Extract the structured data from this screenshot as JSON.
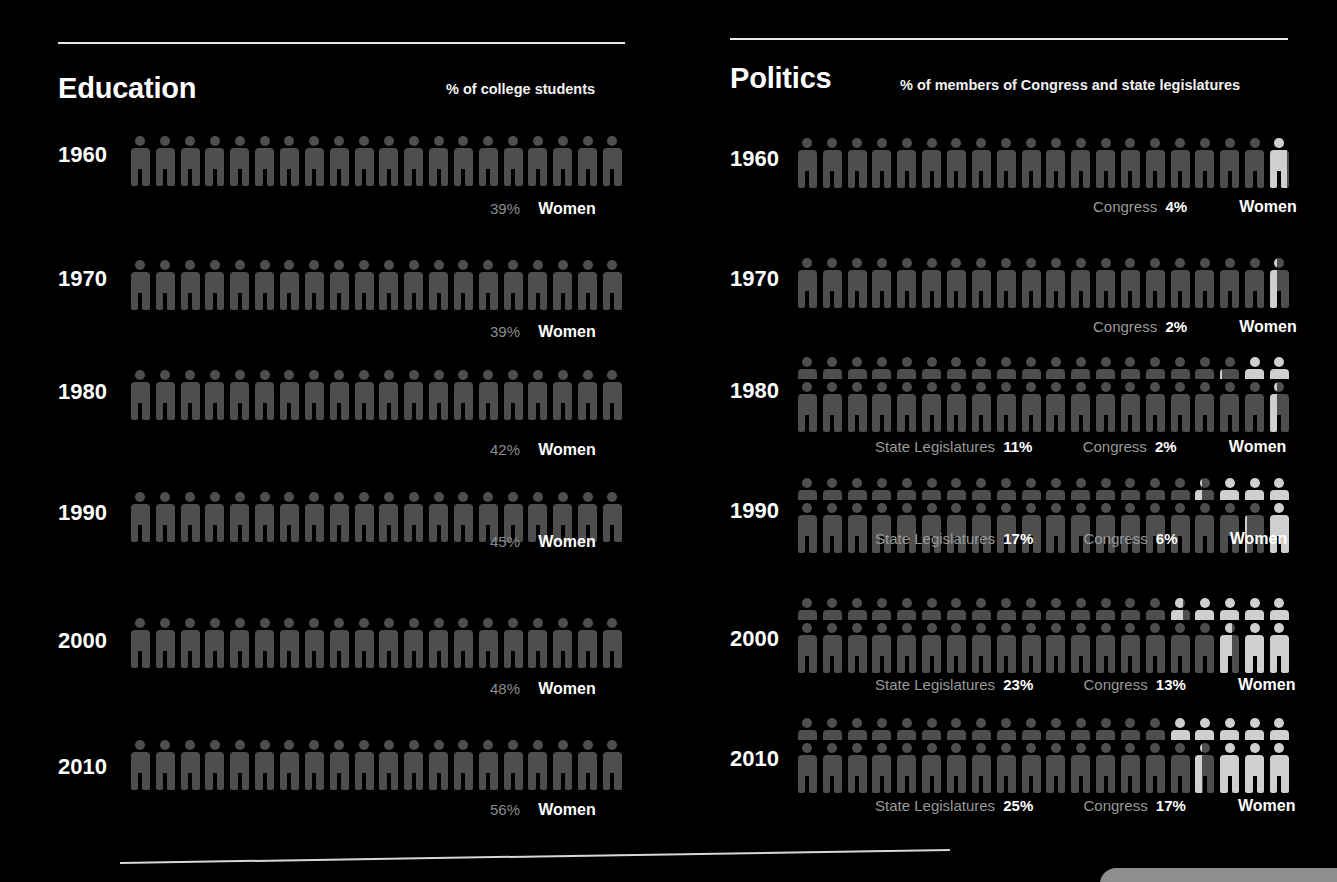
{
  "background_color": "#000000",
  "colors": {
    "figure_gray": "#4e4e4e",
    "figure_highlight": "#cfcfcf",
    "rule": "#e8e8e8",
    "caption_term": "#9a9a9a",
    "caption_value": "#ffffff"
  },
  "panels": {
    "education": {
      "title": "Education",
      "subtitle": "% of college students",
      "women_label": "Women",
      "rows": [
        {
          "year": "1960",
          "pct_label": "39%",
          "value": 39
        },
        {
          "year": "1970",
          "pct_label": "39%",
          "value": 39
        },
        {
          "year": "1980",
          "pct_label": "42%",
          "value": 42
        },
        {
          "year": "1990",
          "pct_label": "45%",
          "value": 45
        },
        {
          "year": "2000",
          "pct_label": "48%",
          "value": 48
        },
        {
          "year": "2010",
          "pct_label": "56%",
          "value": 56
        }
      ]
    },
    "politics": {
      "title": "Politics",
      "subtitle": "% of members of Congress and state legislatures",
      "women_label": "Women",
      "state_label": "State Legislatures",
      "congress_label": "Congress",
      "rows": [
        {
          "year": "1960",
          "state_pct_label": "",
          "state_value": null,
          "congress_pct_label": "4%",
          "congress_value": 4
        },
        {
          "year": "1970",
          "state_pct_label": "",
          "state_value": null,
          "congress_pct_label": "2%",
          "congress_value": 2
        },
        {
          "year": "1980",
          "state_pct_label": "11%",
          "state_value": 11,
          "congress_pct_label": "2%",
          "congress_value": 2
        },
        {
          "year": "1990",
          "state_pct_label": "17%",
          "state_value": 17,
          "congress_pct_label": "6%",
          "congress_value": 6
        },
        {
          "year": "2000",
          "state_pct_label": "23%",
          "state_value": 23,
          "congress_pct_label": "13%",
          "congress_value": 13
        },
        {
          "year": "2010",
          "state_pct_label": "25%",
          "state_value": 25,
          "congress_pct_label": "17%",
          "congress_value": 17
        }
      ]
    }
  },
  "chart_data": {
    "type": "pictogram",
    "icons_per_row": 20,
    "icon_unit_percent": 5,
    "charts": [
      {
        "type": "pictogram",
        "title": "Education",
        "subtitle": "% of college students",
        "series_name": "Women",
        "categories": [
          "1960",
          "1970",
          "1980",
          "1990",
          "2000",
          "2010"
        ],
        "values": [
          39,
          39,
          42,
          45,
          48,
          56
        ],
        "ylabel": "% of college students who are women",
        "ylim": [
          0,
          100
        ]
      },
      {
        "type": "pictogram",
        "title": "Politics",
        "subtitle": "% of members of Congress and state legislatures",
        "categories": [
          "1960",
          "1970",
          "1980",
          "1990",
          "2000",
          "2010"
        ],
        "series": [
          {
            "name": "State Legislatures",
            "values": [
              null,
              null,
              11,
              17,
              23,
              25
            ]
          },
          {
            "name": "Congress",
            "values": [
              4,
              2,
              2,
              6,
              13,
              17
            ]
          }
        ],
        "ylabel": "% of seats held by women",
        "ylim": [
          0,
          100
        ]
      }
    ]
  }
}
